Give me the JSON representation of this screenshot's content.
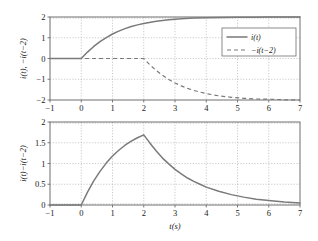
{
  "figure": {
    "title": "",
    "background": "#ffffff",
    "curve_color": "#7a7a7a",
    "axis_color": "#6e6e6e",
    "grid_color": "#a8a8a8"
  },
  "chart_data": [
    {
      "type": "line",
      "id": "top-panel",
      "title": "",
      "xlabel": "",
      "ylabel": "i(t), −i(t−2)",
      "xlim": [
        -1,
        7
      ],
      "ylim": [
        -2,
        2
      ],
      "xticks": [
        -1,
        0,
        1,
        2,
        3,
        4,
        5,
        6,
        7
      ],
      "xticklabels": [
        "−1",
        "0",
        "1",
        "2",
        "3",
        "4",
        "5",
        "6",
        "7"
      ],
      "yticks": [
        -2,
        -1,
        0,
        1,
        2
      ],
      "yticklabels": [
        "−2",
        "−1",
        "0",
        "1",
        "2"
      ],
      "grid": true,
      "legend_position": "upper right",
      "series": [
        {
          "name": "i(t)",
          "style": "solid",
          "x": [
            -1,
            -0.5,
            0,
            0.2,
            0.4,
            0.6,
            0.8,
            1.0,
            1.2,
            1.4,
            1.6,
            1.8,
            2.0,
            2.4,
            2.8,
            3.2,
            3.6,
            4.0,
            4.5,
            5.0,
            5.5,
            6.0,
            6.5,
            7.0
          ],
          "y": [
            0,
            0,
            0,
            0.31,
            0.58,
            0.81,
            1.01,
            1.18,
            1.32,
            1.44,
            1.54,
            1.62,
            1.69,
            1.8,
            1.87,
            1.92,
            1.95,
            1.96,
            1.98,
            1.99,
            1.99,
            2.0,
            2.0,
            2.0
          ]
        },
        {
          "name": "−i(t−2)",
          "style": "dashed",
          "x": [
            -1,
            0,
            1,
            2,
            2.2,
            2.4,
            2.6,
            2.8,
            3.0,
            3.2,
            3.4,
            3.6,
            3.8,
            4.0,
            4.4,
            4.8,
            5.2,
            5.6,
            6.0,
            6.5,
            7.0
          ],
          "y": [
            0,
            0,
            0,
            0,
            -0.31,
            -0.58,
            -0.81,
            -1.01,
            -1.18,
            -1.32,
            -1.44,
            -1.54,
            -1.62,
            -1.69,
            -1.8,
            -1.87,
            -1.92,
            -1.95,
            -1.96,
            -1.99,
            -2.0
          ]
        }
      ]
    },
    {
      "type": "line",
      "id": "bottom-panel",
      "title": "",
      "xlabel": "t(s)",
      "ylabel": "i(t)−i(t−2)",
      "xlim": [
        -1,
        7
      ],
      "ylim": [
        0,
        2
      ],
      "xticks": [
        -1,
        0,
        1,
        2,
        3,
        4,
        5,
        6,
        7
      ],
      "xticklabels": [
        "−1",
        "0",
        "1",
        "2",
        "3",
        "4",
        "5",
        "6",
        "7"
      ],
      "yticks": [
        0,
        0.5,
        1,
        1.5,
        2
      ],
      "yticklabels": [
        "0",
        "0.5",
        "1",
        "1.5",
        "2"
      ],
      "grid": true,
      "legend_position": "none",
      "series": [
        {
          "name": "i(t)−i(t−2)",
          "style": "solid",
          "x": [
            -1,
            -0.5,
            0,
            0.2,
            0.4,
            0.6,
            0.8,
            1.0,
            1.2,
            1.4,
            1.6,
            1.8,
            2.0,
            2.2,
            2.4,
            2.6,
            2.8,
            3.0,
            3.2,
            3.4,
            3.6,
            3.8,
            4.0,
            4.4,
            4.8,
            5.2,
            5.6,
            6.0,
            6.5,
            7.0
          ],
          "y": [
            0,
            0,
            0,
            0.31,
            0.58,
            0.81,
            1.01,
            1.18,
            1.32,
            1.44,
            1.54,
            1.62,
            1.69,
            1.49,
            1.3,
            1.13,
            0.99,
            0.86,
            0.75,
            0.65,
            0.57,
            0.5,
            0.43,
            0.33,
            0.25,
            0.19,
            0.14,
            0.11,
            0.07,
            0.05
          ]
        }
      ]
    }
  ],
  "legend": {
    "entries": [
      {
        "label": "i(t)",
        "style": "solid"
      },
      {
        "label": "−i(t−2)",
        "style": "dashed"
      }
    ]
  }
}
